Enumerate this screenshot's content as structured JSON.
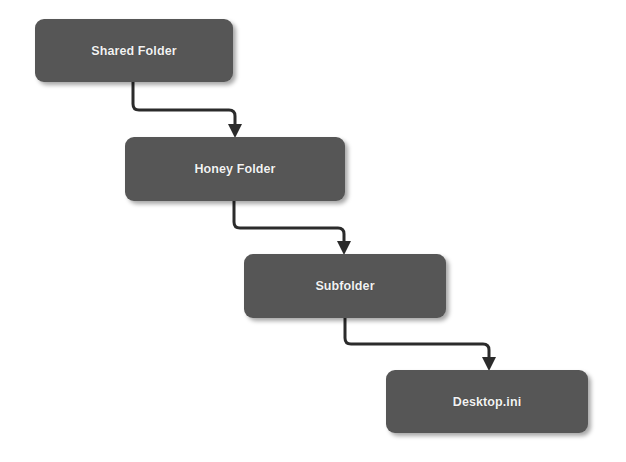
{
  "diagram": {
    "type": "hierarchy-flow",
    "colors": {
      "node_fill": "#565656",
      "node_text": "#f2f2f2",
      "connector": "#2b2b2b",
      "background": "#ffffff"
    },
    "nodes": [
      {
        "id": "shared-folder",
        "label": "Shared Folder",
        "x": 35,
        "y": 19,
        "w": 198,
        "h": 63
      },
      {
        "id": "honey-folder",
        "label": "Honey Folder",
        "x": 125,
        "y": 137,
        "w": 220,
        "h": 64
      },
      {
        "id": "subfolder",
        "label": "Subfolder",
        "x": 244,
        "y": 254,
        "w": 202,
        "h": 64
      },
      {
        "id": "desktop-ini",
        "label": "Desktop.ini",
        "x": 386,
        "y": 370,
        "w": 202,
        "h": 63
      }
    ],
    "edges": [
      {
        "from": "shared-folder",
        "to": "honey-folder"
      },
      {
        "from": "honey-folder",
        "to": "subfolder"
      },
      {
        "from": "subfolder",
        "to": "desktop-ini"
      }
    ]
  }
}
